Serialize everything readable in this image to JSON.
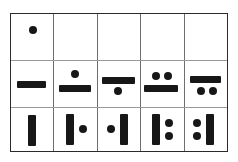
{
  "chart_data": {
    "type": "table",
    "title": "",
    "rows": 3,
    "columns": 5,
    "colors": {
      "glyph": "#171717",
      "outer_border": "#2b2b2b",
      "inner_rule": "#6e6e6e",
      "row_rule": "#9a9a9a",
      "background": "#ffffff"
    },
    "cells": [
      {
        "row": 1,
        "column": 1,
        "value": 1,
        "glyphs": [
          "dot"
        ],
        "dots": 1,
        "bars": 0,
        "layout": "single-dot-centered"
      },
      {
        "row": 1,
        "column": 2,
        "value": null,
        "glyphs": [],
        "dots": 0,
        "bars": 0,
        "layout": "empty"
      },
      {
        "row": 1,
        "column": 3,
        "value": null,
        "glyphs": [],
        "dots": 0,
        "bars": 0,
        "layout": "empty"
      },
      {
        "row": 1,
        "column": 4,
        "value": null,
        "glyphs": [],
        "dots": 0,
        "bars": 0,
        "layout": "empty"
      },
      {
        "row": 1,
        "column": 5,
        "value": null,
        "glyphs": [],
        "dots": 0,
        "bars": 0,
        "layout": "empty"
      },
      {
        "row": 2,
        "column": 1,
        "value": 5,
        "glyphs": [
          "horizontal-bar"
        ],
        "dots": 0,
        "bars": 1,
        "layout": "bar-only"
      },
      {
        "row": 2,
        "column": 2,
        "value": 6,
        "glyphs": [
          "dot",
          "horizontal-bar"
        ],
        "dots": 1,
        "bars": 1,
        "layout": "dot-above-bar"
      },
      {
        "row": 2,
        "column": 3,
        "value": 6,
        "glyphs": [
          "horizontal-bar",
          "dot"
        ],
        "dots": 1,
        "bars": 1,
        "layout": "bar-above-dot"
      },
      {
        "row": 2,
        "column": 4,
        "value": 7,
        "glyphs": [
          "dot",
          "dot",
          "horizontal-bar"
        ],
        "dots": 2,
        "bars": 1,
        "layout": "two-dots-above-bar"
      },
      {
        "row": 2,
        "column": 5,
        "value": 7,
        "glyphs": [
          "horizontal-bar",
          "dot",
          "dot"
        ],
        "dots": 2,
        "bars": 1,
        "layout": "bar-above-two-dots"
      },
      {
        "row": 3,
        "column": 1,
        "value": 5,
        "glyphs": [
          "vertical-bar"
        ],
        "dots": 0,
        "bars": 1,
        "layout": "vertical-bar-only"
      },
      {
        "row": 3,
        "column": 2,
        "value": 6,
        "glyphs": [
          "vertical-bar",
          "dot"
        ],
        "dots": 1,
        "bars": 1,
        "layout": "bar-left-dot-right"
      },
      {
        "row": 3,
        "column": 3,
        "value": 6,
        "glyphs": [
          "dot",
          "vertical-bar"
        ],
        "dots": 1,
        "bars": 1,
        "layout": "dot-left-bar-right"
      },
      {
        "row": 3,
        "column": 4,
        "value": 7,
        "glyphs": [
          "vertical-bar",
          "dot",
          "dot"
        ],
        "dots": 2,
        "bars": 1,
        "layout": "bar-left-two-dots-right"
      },
      {
        "row": 3,
        "column": 5,
        "value": 7,
        "glyphs": [
          "dot",
          "dot",
          "vertical-bar"
        ],
        "dots": 2,
        "bars": 1,
        "layout": "two-dots-left-bar-right"
      }
    ]
  }
}
